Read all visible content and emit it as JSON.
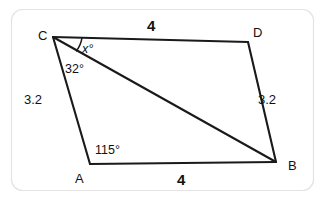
{
  "figure": {
    "kind": "geometry-diagram",
    "shape": "quadrilateral",
    "background_color": "#ffffff",
    "line_color": "#1a1a1a",
    "border_color": "#e3e3e3",
    "vertices": [
      {
        "name": "C",
        "label": "C",
        "x": 53,
        "y": 37
      },
      {
        "name": "D",
        "label": "D",
        "x": 248,
        "y": 42
      },
      {
        "name": "B",
        "label": "B",
        "x": 276,
        "y": 162
      },
      {
        "name": "A",
        "label": "A",
        "x": 90,
        "y": 164
      }
    ],
    "vertex_labels": {
      "C": "C",
      "D": "D",
      "B": "B",
      "A": "A"
    },
    "side_labels": {
      "CD": "4",
      "AB": "4",
      "CA": "3.2",
      "DB": "3.2"
    },
    "angle_labels": {
      "at_C_upper": "x°",
      "at_C_lower": "32°",
      "at_A": "115°"
    },
    "diagonal": "C-B"
  }
}
